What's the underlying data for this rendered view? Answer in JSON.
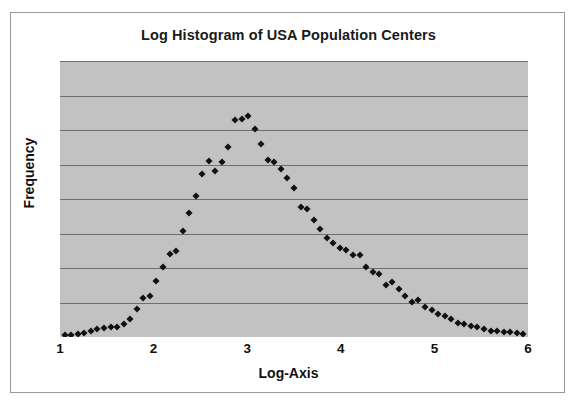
{
  "chart_data": {
    "type": "scatter",
    "title": "Log Histogram of USA Population Centers",
    "xlabel": "Log-Axis",
    "ylabel": "Frequency",
    "xlim": [
      1,
      6
    ],
    "ylim": [
      0,
      8
    ],
    "xticks": [
      1,
      2,
      3,
      4,
      5,
      6
    ],
    "xtick_labels": [
      "1",
      "2",
      "3",
      "4",
      "5",
      "6"
    ],
    "ytick_labels": [],
    "grid": "horizontal",
    "gridline_count": 8,
    "legend": null,
    "marker": "diamond",
    "marker_color": "#111111",
    "plot_background": "#c2c2c2",
    "figure_background": "#ffffff",
    "x": [
      1.05,
      1.12,
      1.19,
      1.26,
      1.33,
      1.4,
      1.47,
      1.54,
      1.61,
      1.68,
      1.75,
      1.82,
      1.89,
      1.96,
      2.03,
      2.1,
      2.17,
      2.24,
      2.31,
      2.38,
      2.45,
      2.52,
      2.59,
      2.66,
      2.73,
      2.8,
      2.87,
      2.94,
      3.01,
      3.08,
      3.15,
      3.22,
      3.29,
      3.36,
      3.43,
      3.5,
      3.57,
      3.64,
      3.71,
      3.78,
      3.85,
      3.92,
      3.99,
      4.06,
      4.13,
      4.2,
      4.27,
      4.34,
      4.41,
      4.48,
      4.55,
      4.62,
      4.69,
      4.76,
      4.83,
      4.9,
      4.97,
      5.04,
      5.11,
      5.18,
      5.25,
      5.32,
      5.39,
      5.46,
      5.53,
      5.6,
      5.67,
      5.74,
      5.81,
      5.88,
      5.95
    ],
    "y": [
      0.05,
      0.06,
      0.08,
      0.12,
      0.17,
      0.22,
      0.25,
      0.3,
      0.28,
      0.38,
      0.52,
      0.8,
      1.12,
      1.18,
      1.62,
      2.02,
      2.42,
      2.5,
      3.08,
      3.58,
      4.1,
      4.72,
      5.1,
      4.82,
      5.08,
      5.52,
      6.3,
      6.32,
      6.4,
      6.02,
      5.58,
      5.12,
      5.08,
      4.88,
      4.6,
      4.32,
      3.78,
      3.72,
      3.4,
      3.12,
      2.88,
      2.72,
      2.58,
      2.52,
      2.38,
      2.38,
      2.02,
      1.88,
      1.82,
      1.52,
      1.6,
      1.4,
      1.18,
      1.02,
      1.06,
      0.88,
      0.78,
      0.68,
      0.62,
      0.52,
      0.42,
      0.38,
      0.32,
      0.3,
      0.22,
      0.18,
      0.16,
      0.14,
      0.14,
      0.12,
      0.1
    ]
  }
}
